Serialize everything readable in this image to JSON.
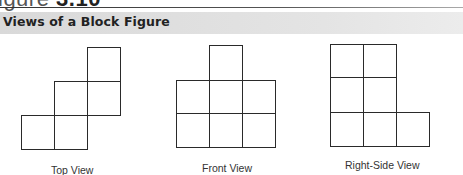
{
  "header": {
    "figure_label_prefix": "igure",
    "figure_label_number": "3.10",
    "band_title": "Views of a Block Figure"
  },
  "views": [
    {
      "name": "top",
      "caption": "Top View",
      "grid": [
        [
          0,
          0,
          1
        ],
        [
          0,
          1,
          1
        ],
        [
          1,
          1,
          0
        ]
      ]
    },
    {
      "name": "front",
      "caption": "Front View",
      "grid": [
        [
          0,
          1,
          0
        ],
        [
          1,
          1,
          1
        ],
        [
          1,
          1,
          1
        ]
      ]
    },
    {
      "name": "right-side",
      "caption": "Right-Side View",
      "grid": [
        [
          1,
          1,
          0
        ],
        [
          1,
          1,
          0
        ],
        [
          1,
          1,
          1
        ]
      ]
    }
  ],
  "colors": {
    "line": "#2a2a2a",
    "band": "#e0e0e0"
  }
}
